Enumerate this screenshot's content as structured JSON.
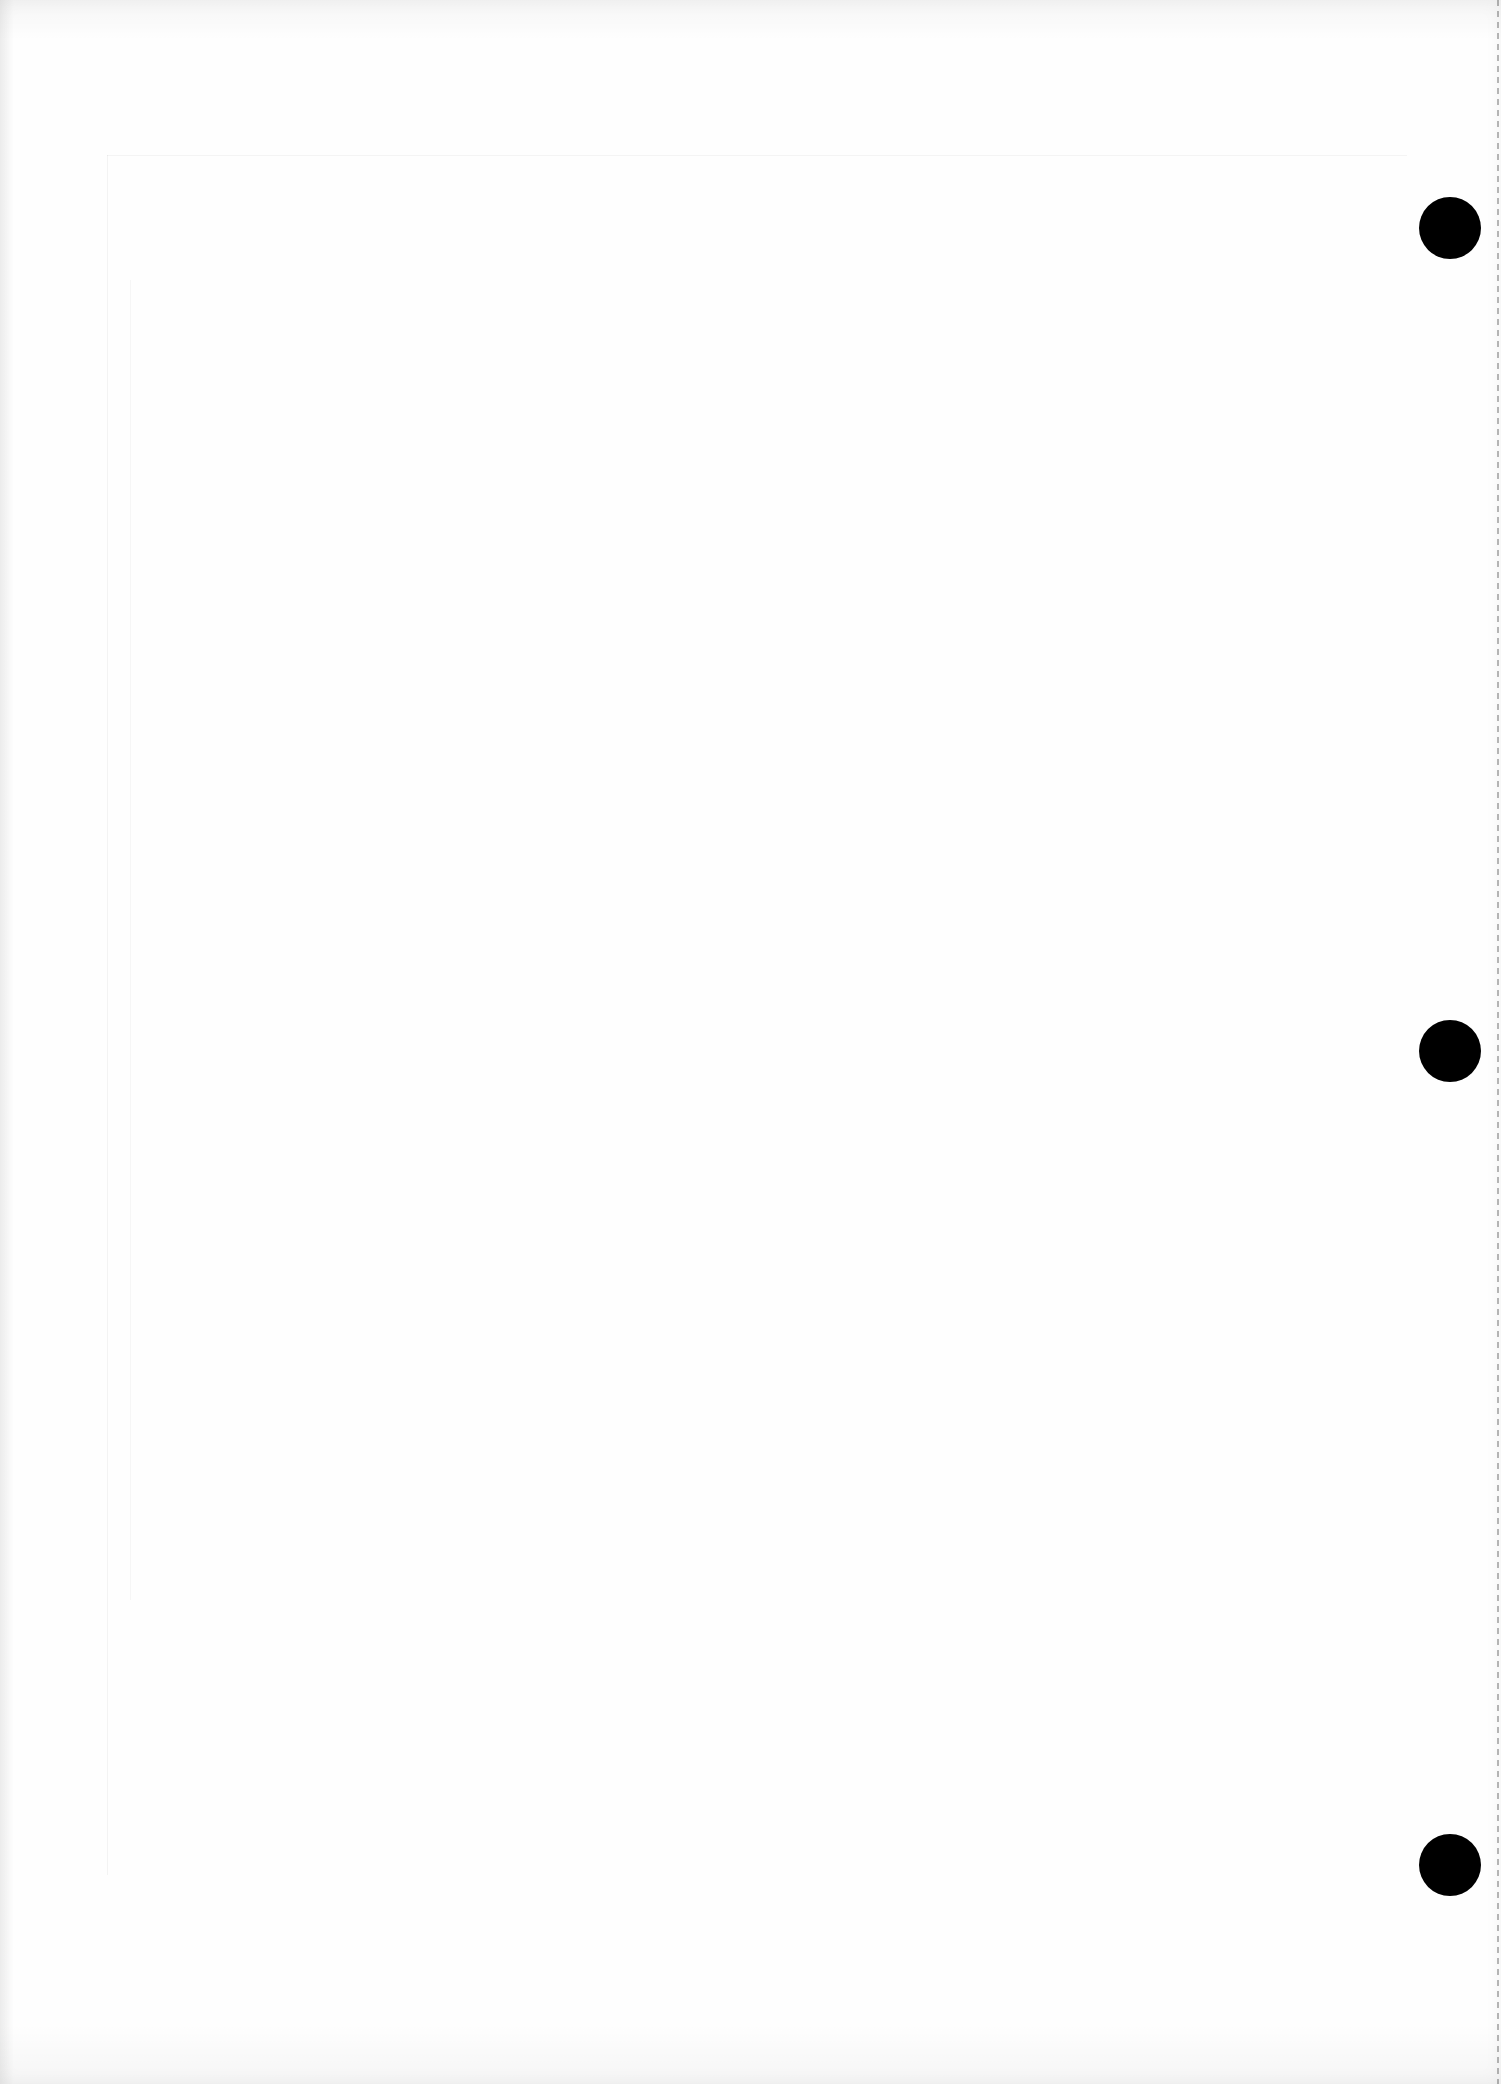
{
  "document": {
    "type": "scanned blank page",
    "background_color": "#fefefe",
    "text_content": []
  },
  "punch_holes": [
    {
      "name": "top-punch-hole",
      "cx": 1450,
      "cy": 228,
      "diameter": 62,
      "color": "#000000"
    },
    {
      "name": "middle-punch-hole",
      "cx": 1450,
      "cy": 1051,
      "diameter": 62,
      "color": "#000000"
    },
    {
      "name": "bottom-punch-hole",
      "cx": 1450,
      "cy": 1865,
      "diameter": 62,
      "color": "#000000"
    }
  ],
  "perforation": {
    "side": "right",
    "style": "dashed"
  }
}
